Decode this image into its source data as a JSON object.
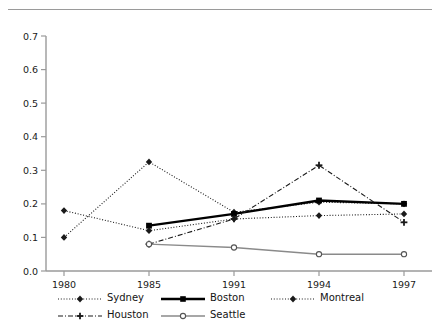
{
  "chart_data": {
    "type": "line",
    "title": "",
    "xlabel": "",
    "ylabel": "",
    "categories": [
      "1980",
      "1985",
      "1991",
      "1994",
      "1997"
    ],
    "ylim": [
      0.0,
      0.7
    ],
    "yticks": [
      "0.0",
      "0.1",
      "0.2",
      "0.3",
      "0.4",
      "0.5",
      "0.6",
      "0.7"
    ],
    "ytick_values": [
      0.0,
      0.1,
      0.2,
      0.3,
      0.4,
      0.5,
      0.6,
      0.7
    ],
    "grid": false,
    "legend_position": "bottom",
    "series": [
      {
        "name": "Sydney",
        "style": "dotted",
        "marker": "diamond",
        "color": "#1a1a1a",
        "x": [
          "1980",
          "1985",
          "1991",
          "1994",
          "1997"
        ],
        "values": [
          0.1,
          0.325,
          0.175,
          0.205,
          0.2
        ]
      },
      {
        "name": "Boston",
        "style": "solid-thick",
        "marker": "square",
        "color": "#000000",
        "x": [
          "1985",
          "1991",
          "1994",
          "1997"
        ],
        "values": [
          0.135,
          0.17,
          0.21,
          0.2
        ]
      },
      {
        "name": "Montreal",
        "style": "dotted",
        "marker": "diamond",
        "color": "#1a1a1a",
        "x": [
          "1980",
          "1985",
          "1991",
          "1994",
          "1997"
        ],
        "values": [
          0.18,
          0.12,
          0.155,
          0.165,
          0.17
        ]
      },
      {
        "name": "Houston",
        "style": "dash-dot",
        "marker": "cross",
        "color": "#1a1a1a",
        "x": [
          "1985",
          "1991",
          "1994",
          "1997"
        ],
        "values": [
          0.08,
          0.155,
          0.315,
          0.145
        ]
      },
      {
        "name": "Seattle",
        "style": "solid-thin",
        "marker": "circle-open",
        "color": "#8a8a8a",
        "x": [
          "1985",
          "1991",
          "1994",
          "1997"
        ],
        "values": [
          0.08,
          0.07,
          0.05,
          0.05
        ]
      }
    ]
  },
  "legend": {
    "sydney": "Sydney",
    "boston": "Boston",
    "montreal": "Montreal",
    "houston": "Houston",
    "seattle": "Seattle"
  },
  "axis": {
    "y": [
      "0.7",
      "0.6",
      "0.5",
      "0.4",
      "0.3",
      "0.2",
      "0.1",
      "0.0"
    ],
    "x": [
      "1980",
      "1985",
      "1991",
      "1994",
      "1997"
    ]
  }
}
